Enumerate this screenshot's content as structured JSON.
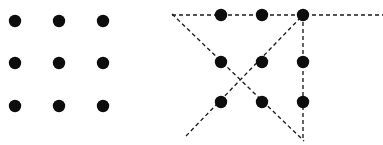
{
  "figure": {
    "width": 383,
    "height": 145,
    "background_color": "#ffffff",
    "dot_color": "#0d0d0d",
    "line_color": "#1a1a1a",
    "dot_radius": 6.2,
    "line_width": 1.35,
    "dash_pattern": "4,3"
  },
  "panels": [
    {
      "id": "left-panel",
      "name": "nine-dot-grid-unsolved",
      "label": "",
      "has_lines": false,
      "dots": [
        {
          "name": "dot-r1c1",
          "cx": 15,
          "cy": 21
        },
        {
          "name": "dot-r1c2",
          "cx": 59,
          "cy": 21
        },
        {
          "name": "dot-r1c3",
          "cx": 103,
          "cy": 21
        },
        {
          "name": "dot-r2c1",
          "cx": 15,
          "cy": 63
        },
        {
          "name": "dot-r2c2",
          "cx": 59,
          "cy": 63
        },
        {
          "name": "dot-r2c3",
          "cx": 103,
          "cy": 63
        },
        {
          "name": "dot-r3c1",
          "cx": 15,
          "cy": 106
        },
        {
          "name": "dot-r3c2",
          "cx": 59,
          "cy": 106
        },
        {
          "name": "dot-r3c3",
          "cx": 103,
          "cy": 106
        }
      ],
      "lines": []
    },
    {
      "id": "right-panel",
      "name": "nine-dot-grid-solution",
      "label": "",
      "has_lines": true,
      "dots": [
        {
          "name": "dot-r1c1",
          "cx": 221,
          "cy": 15
        },
        {
          "name": "dot-r1c2",
          "cx": 262,
          "cy": 15
        },
        {
          "name": "dot-r1c3",
          "cx": 303,
          "cy": 15
        },
        {
          "name": "dot-r2c1",
          "cx": 221,
          "cy": 62
        },
        {
          "name": "dot-r2c2",
          "cx": 262,
          "cy": 62
        },
        {
          "name": "dot-r2c3",
          "cx": 303,
          "cy": 62
        },
        {
          "name": "dot-r3c1",
          "cx": 221,
          "cy": 102
        },
        {
          "name": "dot-r3c2",
          "cx": 262,
          "cy": 102
        },
        {
          "name": "dot-r3c3",
          "cx": 303,
          "cy": 102
        }
      ],
      "lines": [
        {
          "name": "line-horizontal-top",
          "order": 1,
          "x1": 172,
          "y1": 15,
          "x2": 383,
          "y2": 15
        },
        {
          "name": "line-diagonal-descending",
          "order": 2,
          "x1": 172,
          "y1": 14,
          "x2": 304,
          "y2": 141
        },
        {
          "name": "line-diagonal-ascending",
          "order": 3,
          "x1": 186,
          "y1": 136,
          "x2": 304,
          "y2": 14
        },
        {
          "name": "line-vertical-right",
          "order": 4,
          "x1": 303,
          "y1": 15,
          "x2": 303,
          "y2": 141
        }
      ]
    }
  ]
}
